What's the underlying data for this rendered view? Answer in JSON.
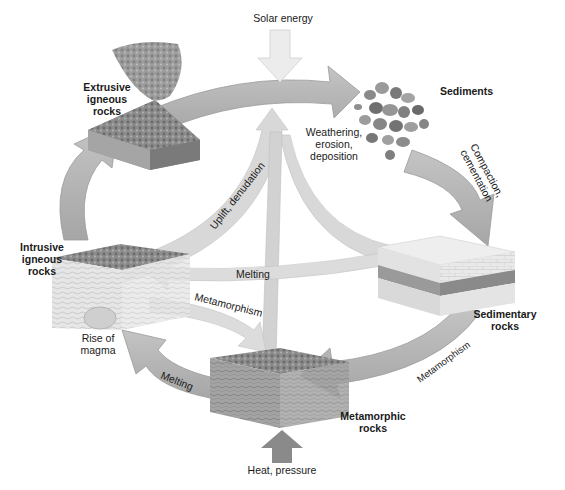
{
  "diagram": {
    "colors": {
      "cycle_arrow": "#b4b4b4",
      "cycle_arrow_edge": "#9a9a9a",
      "inner_arrow": "#d6d6d6",
      "solar_arrow": "#e8e8e8",
      "heat_arrow": "#8a8a8a",
      "text": "#1a1a1a"
    },
    "nodes": {
      "extrusive": {
        "line1": "Extrusive",
        "line2": "igneous",
        "line3": "rocks"
      },
      "sediments": {
        "line1": "Sediments"
      },
      "sedimentary": {
        "line1": "Sedimentary",
        "line2": "rocks"
      },
      "metamorphic": {
        "line1": "Metamorphic",
        "line2": "rocks"
      },
      "intrusive": {
        "line1": "Intrusive",
        "line2": "igneous",
        "line3": "rocks"
      }
    },
    "processes": {
      "solar": "Solar energy",
      "weathering": {
        "line1": "Weathering,",
        "line2": "erosion,",
        "line3": "deposition"
      },
      "compaction": {
        "line1": "Compaction,",
        "line2": "cementation"
      },
      "metamorphism_right": "Metamorphism",
      "heat": "Heat, pressure",
      "melting_bottom": "Melting",
      "rise": {
        "line1": "Rise of",
        "line2": "magma"
      },
      "uplift": "Uplift, denudation",
      "melting_center": "Melting",
      "metamorphism_center": "Metamorphism"
    }
  }
}
